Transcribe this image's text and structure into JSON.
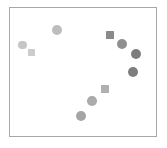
{
  "figure": {
    "width": 167,
    "height": 148,
    "background": "#ffffff"
  },
  "plot_frame": {
    "left": 9,
    "top": 7,
    "width": 148,
    "height": 130,
    "border_color": "#a8a8a8",
    "border_width": 1,
    "background": "#ffffff"
  },
  "chart_data": {
    "type": "scatter",
    "title": "",
    "subtitle": "",
    "xlabel": "",
    "ylabel": "",
    "xlim": [
      0,
      1
    ],
    "ylim": [
      0,
      1
    ],
    "xticks": [],
    "yticks": [],
    "xticklabels": [],
    "yticklabels": [],
    "grid": false,
    "legend": false,
    "legend_position": "none",
    "annotations": [],
    "colormap": "grayscale",
    "marker_shapes": [
      "circle",
      "square"
    ],
    "n_points": 10,
    "points": [
      {
        "id": "p1",
        "shape": "circle",
        "x": 0.092,
        "y": 0.708,
        "px": 22.5,
        "py": 45.0,
        "size": 8.5,
        "color": "#c6c6c6"
      },
      {
        "id": "p2",
        "shape": "square",
        "x": 0.149,
        "y": 0.654,
        "px": 31.0,
        "py": 52.0,
        "size": 7.0,
        "color": "#cccccc"
      },
      {
        "id": "p3",
        "shape": "circle",
        "x": 0.324,
        "y": 0.823,
        "px": 57.0,
        "py": 30.0,
        "size": 10.0,
        "color": "#bdbdbd"
      },
      {
        "id": "p4",
        "shape": "square",
        "x": 0.682,
        "y": 0.785,
        "px": 110.0,
        "py": 35.0,
        "size": 7.5,
        "color": "#8a8a8a"
      },
      {
        "id": "p5",
        "shape": "circle",
        "x": 0.764,
        "y": 0.715,
        "px": 122.0,
        "py": 44.0,
        "size": 10.5,
        "color": "#8f8f8f"
      },
      {
        "id": "p6",
        "shape": "circle",
        "x": 0.858,
        "y": 0.638,
        "px": 136.0,
        "py": 54.0,
        "size": 10.5,
        "color": "#7e7e7e"
      },
      {
        "id": "p7",
        "shape": "circle",
        "x": 0.838,
        "y": 0.5,
        "px": 133.0,
        "py": 72.0,
        "size": 10.5,
        "color": "#7e7e7e"
      },
      {
        "id": "p8",
        "shape": "square",
        "x": 0.649,
        "y": 0.369,
        "px": 105.0,
        "py": 89.0,
        "size": 7.5,
        "color": "#b0b0b0"
      },
      {
        "id": "p9",
        "shape": "circle",
        "x": 0.561,
        "y": 0.277,
        "px": 92.0,
        "py": 101.0,
        "size": 9.5,
        "color": "#ababab"
      },
      {
        "id": "p10",
        "shape": "circle",
        "x": 0.486,
        "y": 0.162,
        "px": 81.0,
        "py": 116.0,
        "size": 10.0,
        "color": "#a5a5a5"
      }
    ]
  }
}
